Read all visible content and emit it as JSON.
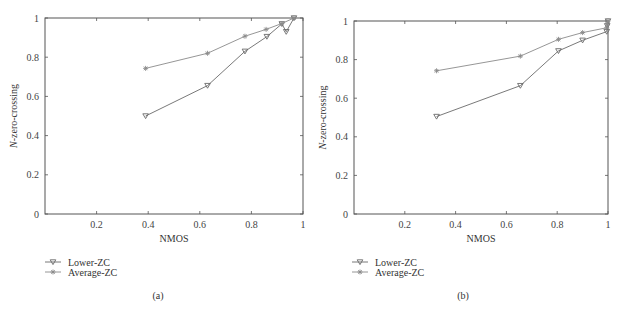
{
  "colors": {
    "axis": "#555555",
    "lower": "#6a6a6a",
    "average": "#8a8a8a"
  },
  "chart_data": [
    {
      "type": "line",
      "caption": "(a)",
      "title": "",
      "xlabel": "NMOS",
      "ylabel": "N-zero-crossing",
      "ylabel_italic_prefix": "N",
      "ylabel_rest": "-zero-crossing",
      "xlim": [
        0,
        1
      ],
      "ylim": [
        0,
        1
      ],
      "xticks": [
        0.2,
        0.4,
        0.6,
        0.8,
        1
      ],
      "xtick_labels": [
        "0.2",
        "0.4",
        "0.6",
        "0.8",
        "1"
      ],
      "yticks": [
        0,
        0.2,
        0.4,
        0.6,
        0.8,
        1
      ],
      "ytick_labels": [
        "0",
        "0.2",
        "0.4",
        "0.6",
        "0.8",
        "1"
      ],
      "grid": false,
      "legend_position": "below-left",
      "series": [
        {
          "name": "Lower-ZC",
          "marker": "triangle-down",
          "x": [
            0.39,
            0.63,
            0.775,
            0.86,
            0.918,
            0.935,
            0.965
          ],
          "y": [
            0.5,
            0.655,
            0.83,
            0.905,
            0.97,
            0.93,
            1.0
          ]
        },
        {
          "name": "Average-ZC",
          "marker": "star",
          "x": [
            0.39,
            0.63,
            0.775,
            0.857,
            0.918,
            0.965
          ],
          "y": [
            0.743,
            0.82,
            0.907,
            0.942,
            0.972,
            1.0
          ]
        }
      ]
    },
    {
      "type": "line",
      "caption": "(b)",
      "title": "",
      "xlabel": "NMOS",
      "ylabel": "N-zero-crossing",
      "ylabel_italic_prefix": "N",
      "ylabel_rest": "-zero-crossing",
      "xlim": [
        0,
        1
      ],
      "ylim": [
        0,
        1
      ],
      "xticks": [
        0.2,
        0.4,
        0.6,
        0.8,
        1
      ],
      "xtick_labels": [
        "0.2",
        "0.4",
        "0.6",
        "0.8",
        "1"
      ],
      "yticks": [
        0,
        0.2,
        0.4,
        0.6,
        0.8,
        1
      ],
      "ytick_labels": [
        "0",
        "0.2",
        "0.4",
        "0.6",
        "0.8",
        "1"
      ],
      "grid": false,
      "legend_position": "below-left",
      "series": [
        {
          "name": "Lower-ZC",
          "marker": "triangle-down",
          "x": [
            0.325,
            0.655,
            0.805,
            0.9,
            0.995,
            0.997,
            1.0
          ],
          "y": [
            0.505,
            0.665,
            0.845,
            0.9,
            0.945,
            0.975,
            1.0
          ]
        },
        {
          "name": "Average-ZC",
          "marker": "star",
          "x": [
            0.325,
            0.655,
            0.805,
            0.9,
            0.995,
            0.997,
            1.0
          ],
          "y": [
            0.742,
            0.818,
            0.905,
            0.94,
            0.965,
            0.985,
            1.0
          ]
        }
      ]
    }
  ],
  "legend": {
    "items": [
      "Lower-ZC",
      "Average-ZC"
    ]
  }
}
